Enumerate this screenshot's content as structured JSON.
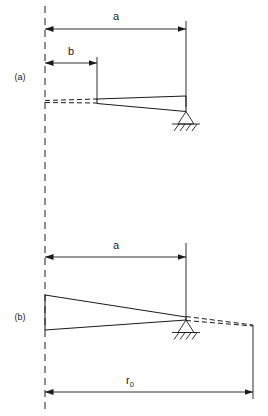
{
  "figure": {
    "background_color": "#ffffff",
    "line_color": "#1a1a1a"
  },
  "panels": [
    {
      "id": "a",
      "label": "(a)",
      "dimensions": [
        {
          "name": "a",
          "label": "a"
        },
        {
          "name": "b",
          "label": "b"
        }
      ],
      "support": "pin-support",
      "beam": "tapered-wedge"
    },
    {
      "id": "b",
      "label": "(b)",
      "dimensions": [
        {
          "name": "a",
          "label": "a"
        },
        {
          "name": "r0",
          "label": "r",
          "subscript": "0"
        }
      ],
      "support": "pin-support",
      "beam": "tapered-wedge"
    }
  ],
  "labels": {
    "panel_a": "(a)",
    "panel_b": "(b)",
    "dim_a_top": "a",
    "dim_b_top": "b",
    "dim_a_bottom": "a",
    "dim_r": "r",
    "dim_r_subscript": "0"
  }
}
